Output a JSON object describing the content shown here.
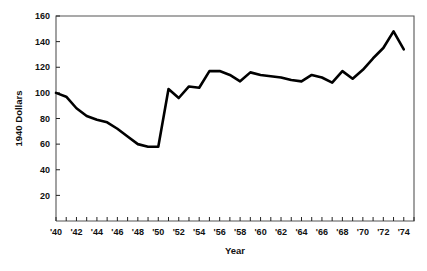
{
  "chart_data": {
    "type": "line",
    "title": "",
    "xlabel": "Year",
    "ylabel": "1940 Dollars",
    "xlim": [
      1940,
      1975
    ],
    "ylim": [
      0,
      160
    ],
    "grid": false,
    "legend": "none",
    "y_ticks": [
      20,
      40,
      60,
      80,
      100,
      120,
      140,
      160
    ],
    "y_tick_labels": [
      "20",
      "40",
      "60",
      "80",
      "100",
      "120",
      "140",
      "160"
    ],
    "x_ticks": [
      1940,
      1941,
      1942,
      1943,
      1944,
      1945,
      1946,
      1947,
      1948,
      1949,
      1950,
      1951,
      1952,
      1953,
      1954,
      1955,
      1956,
      1957,
      1958,
      1959,
      1960,
      1961,
      1962,
      1963,
      1964,
      1965,
      1966,
      1967,
      1968,
      1969,
      1970,
      1971,
      1972,
      1973,
      1974,
      1975
    ],
    "x_tick_labels": [
      "'40",
      "",
      "'42",
      "",
      "'44",
      "",
      "'46",
      "",
      "'48",
      "",
      "'50",
      "",
      "'52",
      "",
      "'54",
      "",
      "'56",
      "",
      "'58",
      "",
      "'60",
      "",
      "'62",
      "",
      "'64",
      "",
      "'66",
      "",
      "'68",
      "",
      "'70",
      "",
      "'72",
      "",
      "'74",
      ""
    ],
    "x": [
      1940,
      1941,
      1942,
      1943,
      1944,
      1945,
      1946,
      1947,
      1948,
      1949,
      1950,
      1951,
      1952,
      1953,
      1954,
      1955,
      1956,
      1957,
      1958,
      1959,
      1960,
      1961,
      1962,
      1963,
      1964,
      1965,
      1966,
      1967,
      1968,
      1969,
      1970,
      1971,
      1972,
      1973,
      1974
    ],
    "values": [
      100,
      97,
      88,
      82,
      79,
      77,
      72,
      66,
      60,
      58,
      58,
      103,
      96,
      105,
      104,
      117,
      117,
      114,
      109,
      116,
      114,
      113,
      112,
      110,
      109,
      114,
      112,
      108,
      117,
      111,
      118,
      127,
      135,
      148,
      134
    ],
    "series": [
      {
        "name": "1940 Dollars",
        "color": "#000000",
        "values": [
          100,
          97,
          88,
          82,
          79,
          77,
          72,
          66,
          60,
          58,
          58,
          103,
          96,
          105,
          104,
          117,
          117,
          114,
          109,
          116,
          114,
          113,
          112,
          110,
          109,
          114,
          112,
          108,
          117,
          111,
          118,
          127,
          135,
          148,
          134
        ]
      }
    ],
    "annotations": []
  },
  "colors": {
    "background": "#ffffff",
    "frame": "#555555",
    "line": "#000000",
    "text": "#111111"
  }
}
